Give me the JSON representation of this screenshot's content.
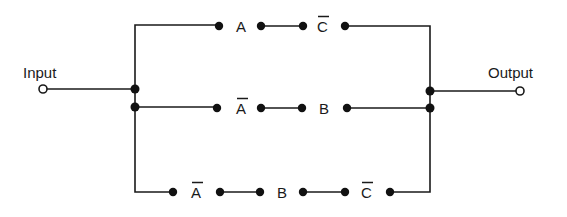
{
  "diagram": {
    "type": "switching-circuit",
    "input_label": "Input",
    "output_label": "Output",
    "branches": [
      {
        "name": "top",
        "contacts": [
          {
            "label": "A",
            "complemented": false
          },
          {
            "label": "C",
            "complemented": true
          }
        ]
      },
      {
        "name": "middle",
        "contacts": [
          {
            "label": "A",
            "complemented": true
          },
          {
            "label": "B",
            "complemented": false
          }
        ]
      },
      {
        "name": "bottom",
        "contacts": [
          {
            "label": "A",
            "complemented": true
          },
          {
            "label": "B",
            "complemented": false
          },
          {
            "label": "C",
            "complemented": true
          }
        ]
      }
    ],
    "colors": {
      "line": "#1a1a1a",
      "background": "#ffffff"
    }
  }
}
